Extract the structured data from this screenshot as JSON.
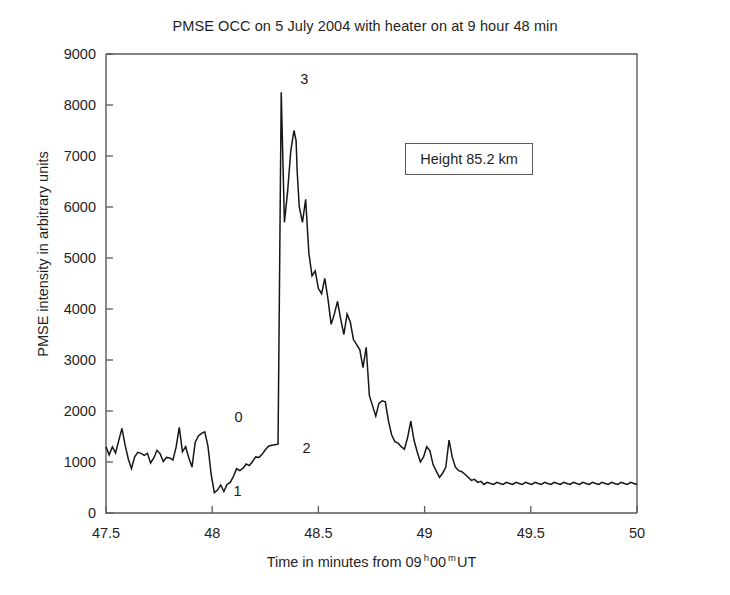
{
  "chart_data": {
    "type": "line",
    "title": "PMSE OCC on 5 July 2004 with heater on at 9 hour 48 min",
    "xlabel_parts": {
      "pre": "Time in minutes from 09",
      "sup1": "h",
      "mid": "00",
      "sup2": "m",
      "post": "UT"
    },
    "xlabel": "Time in minutes from 09 h 00 m UT",
    "ylabel": "PMSE intensity in arbitrary units",
    "xlim": [
      47.5,
      50
    ],
    "ylim": [
      0,
      9000
    ],
    "xticks": [
      47.5,
      48,
      48.5,
      49,
      49.5,
      50
    ],
    "xticklabels": [
      "47.5",
      "48",
      "48.5",
      "49",
      "49.5",
      "50"
    ],
    "yticks": [
      0,
      1000,
      2000,
      3000,
      4000,
      5000,
      6000,
      7000,
      8000,
      9000
    ],
    "yticklabels": [
      "0",
      "1000",
      "2000",
      "3000",
      "4000",
      "5000",
      "6000",
      "7000",
      "8000",
      "9000"
    ],
    "grid": false,
    "legend": false,
    "line_color": "#161616",
    "axis_color": "#5a5a5a",
    "annotations": [
      {
        "text": "Height 85.2 km",
        "x": 49.22,
        "y": 6950,
        "boxed": true
      },
      {
        "text": "0",
        "x": 48.105,
        "y": 1780,
        "boxed": false
      },
      {
        "text": "1",
        "x": 48.1,
        "y": 330,
        "boxed": false
      },
      {
        "text": "2",
        "x": 48.425,
        "y": 1180,
        "boxed": false
      },
      {
        "text": "3",
        "x": 48.415,
        "y": 8420,
        "boxed": false
      }
    ],
    "series": [
      {
        "name": "PMSE intensity",
        "x": [
          47.5,
          47.515,
          47.53,
          47.545,
          47.56,
          47.575,
          47.59,
          47.605,
          47.62,
          47.635,
          47.65,
          47.665,
          47.68,
          47.695,
          47.71,
          47.725,
          47.74,
          47.755,
          47.77,
          47.785,
          47.8,
          47.815,
          47.83,
          47.845,
          47.86,
          47.875,
          47.89,
          47.905,
          47.92,
          47.935,
          47.95,
          47.965,
          47.98,
          47.995,
          48.01,
          48.025,
          48.04,
          48.055,
          48.07,
          48.085,
          48.1,
          48.115,
          48.13,
          48.145,
          48.16,
          48.175,
          48.19,
          48.205,
          48.22,
          48.235,
          48.25,
          48.265,
          48.28,
          48.295,
          48.31,
          48.325,
          48.34,
          48.355,
          48.37,
          48.385,
          48.395,
          48.4,
          48.41,
          48.425,
          48.44,
          48.455,
          48.47,
          48.485,
          48.5,
          48.515,
          48.53,
          48.545,
          48.56,
          48.575,
          48.59,
          48.605,
          48.62,
          48.635,
          48.65,
          48.665,
          48.68,
          48.695,
          48.71,
          48.725,
          48.74,
          48.755,
          48.77,
          48.785,
          48.8,
          48.815,
          48.83,
          48.845,
          48.86,
          48.875,
          48.89,
          48.905,
          48.92,
          48.935,
          48.95,
          48.965,
          48.98,
          48.995,
          49.01,
          49.025,
          49.04,
          49.055,
          49.07,
          49.085,
          49.1,
          49.115,
          49.13,
          49.145,
          49.16,
          49.175,
          49.19,
          49.205,
          49.22,
          49.235,
          49.25,
          49.265,
          49.28,
          49.295,
          49.31,
          49.325,
          49.34,
          49.355,
          49.37,
          49.385,
          49.4,
          49.415,
          49.43,
          49.445,
          49.46,
          49.475,
          49.49,
          49.505,
          49.52,
          49.535,
          49.55,
          49.565,
          49.58,
          49.595,
          49.61,
          49.625,
          49.64,
          49.655,
          49.67,
          49.685,
          49.7,
          49.715,
          49.73,
          49.745,
          49.76,
          49.775,
          49.79,
          49.805,
          49.82,
          49.835,
          49.85,
          49.865,
          49.88,
          49.895,
          49.91,
          49.925,
          49.94,
          49.955,
          49.97,
          49.985,
          50.0
        ],
        "y": [
          1300,
          1140,
          1300,
          1180,
          1420,
          1660,
          1330,
          1060,
          870,
          1100,
          1190,
          1170,
          1130,
          1170,
          980,
          1080,
          1230,
          1160,
          1010,
          1090,
          1080,
          1040,
          1290,
          1680,
          1200,
          1300,
          1080,
          900,
          1390,
          1510,
          1560,
          1590,
          1310,
          760,
          400,
          450,
          550,
          420,
          560,
          600,
          720,
          870,
          830,
          880,
          960,
          930,
          1010,
          1100,
          1090,
          1150,
          1240,
          1310,
          1330,
          1340,
          1350,
          8250,
          5700,
          6300,
          7100,
          7500,
          7300,
          6700,
          6000,
          5700,
          6150,
          5100,
          4650,
          4750,
          4400,
          4300,
          4600,
          4200,
          3700,
          3900,
          4150,
          3800,
          3500,
          3900,
          3750,
          3400,
          3300,
          3200,
          2850,
          3250,
          2300,
          2100,
          1900,
          2150,
          2200,
          2180,
          1800,
          1530,
          1400,
          1370,
          1300,
          1250,
          1480,
          1800,
          1430,
          1200,
          1000,
          1100,
          1300,
          1220,
          950,
          820,
          700,
          780,
          900,
          1430,
          1100,
          900,
          830,
          810,
          760,
          700,
          640,
          660,
          600,
          620,
          560,
          600,
          580,
          560,
          600,
          580,
          560,
          600,
          580,
          560,
          600,
          580,
          560,
          600,
          580,
          560,
          600,
          580,
          560,
          600,
          580,
          560,
          600,
          580,
          560,
          600,
          580,
          560,
          600,
          580,
          560,
          600,
          580,
          560,
          600,
          580,
          560,
          600,
          580,
          560,
          600,
          580,
          560,
          600,
          580,
          560,
          600,
          580,
          560
        ]
      }
    ]
  }
}
